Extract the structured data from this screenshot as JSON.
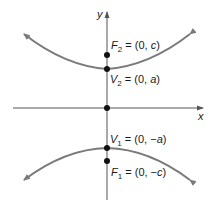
{
  "axes": {
    "x_label": "x",
    "y_label": "y"
  },
  "points": [
    {
      "id": "F2",
      "name": "F",
      "sub": "2",
      "rest": " = (0, ",
      "val": "c",
      "close": ")"
    },
    {
      "id": "V2",
      "name": "V",
      "sub": "2",
      "rest": " = (0, ",
      "val": "a",
      "close": ")"
    },
    {
      "id": "V1",
      "name": "V",
      "sub": "1",
      "rest": " = (0, −",
      "val": "a",
      "close": ")"
    },
    {
      "id": "F1",
      "name": "F",
      "sub": "1",
      "rest": " = (0, −",
      "val": "c",
      "close": ")"
    }
  ],
  "colors": {
    "curve": "#7a7a7a",
    "axis": "#555555",
    "point": "#111111",
    "text": "#1a1a1a"
  }
}
